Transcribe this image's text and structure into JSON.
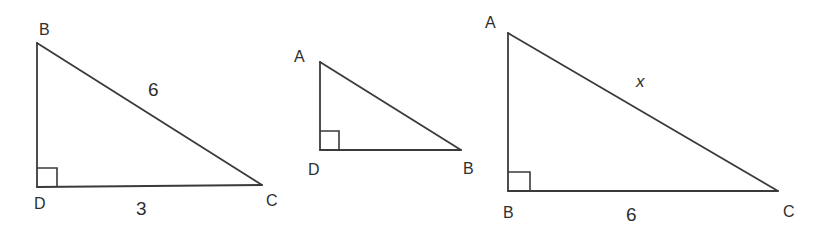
{
  "colors": {
    "line": "#3a3a3a",
    "text": "#2e2e2e",
    "background": "#ffffff"
  },
  "triangles": [
    {
      "id": "BDC",
      "vertices": {
        "top": "B",
        "right_angle": "D",
        "far": "C"
      },
      "right_angle_at": "D",
      "sides": {
        "hypotenuse_BC": "6",
        "base_DC": "3"
      }
    },
    {
      "id": "ADB",
      "vertices": {
        "top": "A",
        "right_angle": "D",
        "far": "B"
      },
      "right_angle_at": "D",
      "sides": {}
    },
    {
      "id": "ABC",
      "vertices": {
        "top": "A",
        "right_angle": "B",
        "far": "C"
      },
      "right_angle_at": "B",
      "sides": {
        "hypotenuse_AC": "x",
        "base_BC": "6"
      }
    }
  ]
}
